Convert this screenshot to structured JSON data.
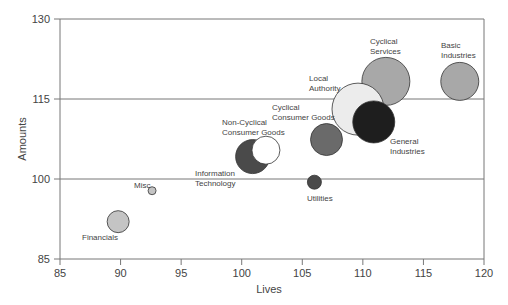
{
  "chart_data": {
    "type": "scatter",
    "subtype": "bubble",
    "title": "",
    "xlabel": "Lives",
    "ylabel": "Amounts",
    "xlim": [
      85,
      120
    ],
    "ylim": [
      85,
      130
    ],
    "xticks": [
      85,
      90,
      95,
      100,
      105,
      110,
      115,
      120
    ],
    "yticks": [
      85,
      100,
      115,
      130
    ],
    "grid": "horizontal at y ticks",
    "legend": "none (direct labels)",
    "points": [
      {
        "label": "Financials",
        "x": 89.8,
        "y": 92,
        "r": 11,
        "fill": "#c4c4c4",
        "lx": 82,
        "ly": 240,
        "anchor": "start"
      },
      {
        "label": "Misc",
        "x": 92.6,
        "y": 97.8,
        "r": 4,
        "fill": "#c4c4c4",
        "lx": 134,
        "ly": 188,
        "anchor": "start"
      },
      {
        "label": "Information Technology",
        "x": 100.9,
        "y": 104.2,
        "r": 17,
        "fill": "#4a4a4a",
        "lx": 195,
        "ly": 176,
        "anchor": "start"
      },
      {
        "label": "Non-Cyclical Consumer Goods",
        "x": 102,
        "y": 105.4,
        "r": 14,
        "fill": "#ffffff",
        "lx": 222,
        "ly": 125,
        "anchor": "start"
      },
      {
        "label": "Utilities",
        "x": 106,
        "y": 99.4,
        "r": 7,
        "fill": "#4a4a4a",
        "lx": 307,
        "ly": 201,
        "anchor": "start"
      },
      {
        "label": "Cyclical Consumer Goods",
        "x": 107,
        "y": 107.4,
        "r": 16,
        "fill": "#6a6a6a",
        "lx": 272,
        "ly": 110,
        "anchor": "start"
      },
      {
        "label": "Cyclical Services",
        "x": 111.9,
        "y": 118.3,
        "r": 24,
        "fill": "#a8a8a8",
        "lx": 370,
        "ly": 44,
        "anchor": "start"
      },
      {
        "label": "Local Authority",
        "x": 109.6,
        "y": 113.1,
        "r": 26,
        "fill": "#ececec",
        "lx": 309,
        "ly": 81,
        "anchor": "start"
      },
      {
        "label": "General Industries",
        "x": 110.9,
        "y": 110.7,
        "r": 21,
        "fill": "#1e1e1e",
        "lx": 390,
        "ly": 144,
        "anchor": "start"
      },
      {
        "label": "Basic Industries",
        "x": 118,
        "y": 118.3,
        "r": 19,
        "fill": "#a8a8a8",
        "lx": 441,
        "ly": 48,
        "anchor": "start"
      }
    ]
  }
}
